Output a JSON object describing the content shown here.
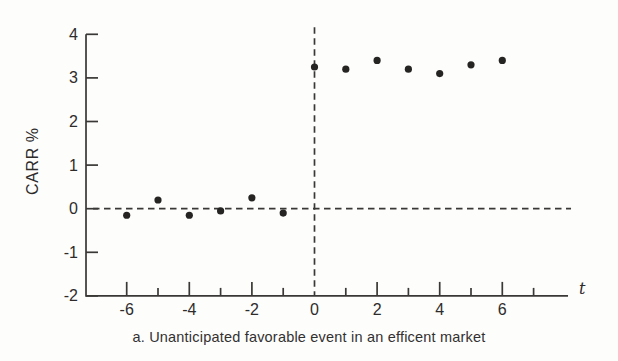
{
  "caption": "a. Unanticipated favorable event in an efficent market",
  "colors": {
    "ink": "#3a3836",
    "dot": "#262423",
    "text": "#2e2c2b",
    "paper": "#fdfdfc"
  },
  "chart_data": {
    "type": "scatter",
    "title": "",
    "xlabel": "t",
    "ylabel": "CARR %",
    "x": [
      -6,
      -5,
      -4,
      -3,
      -2,
      -1,
      0,
      1,
      2,
      3,
      4,
      5,
      6
    ],
    "y": [
      -0.15,
      0.2,
      -0.15,
      -0.05,
      0.25,
      -0.1,
      3.25,
      3.2,
      3.4,
      3.2,
      3.1,
      3.3,
      3.4
    ],
    "xlim": [
      -7.3,
      8.1
    ],
    "ylim": [
      -2,
      4
    ],
    "y_ticks": [
      4,
      3,
      2,
      1,
      0,
      -1,
      -2
    ],
    "x_ticks_long": [
      -6,
      -4,
      -2,
      2,
      4,
      6
    ],
    "x_ticks_short": [
      -5,
      -3,
      -1,
      1,
      3,
      5,
      7
    ],
    "x_tick_labels": [
      -6,
      -4,
      -2,
      0,
      2,
      4,
      6
    ],
    "reference_lines": {
      "horizontal_at_y": 0,
      "vertical_at_x": 0,
      "style": "dashed"
    },
    "grid": false,
    "legend": null,
    "marker": "filled-circle"
  }
}
